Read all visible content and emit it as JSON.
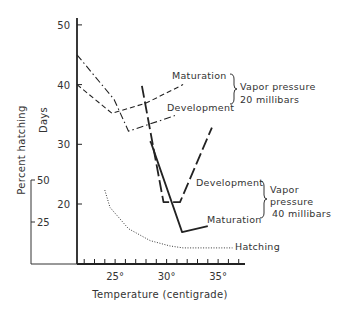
{
  "chart_data": {
    "type": "line",
    "title": "",
    "xlabel": "Temperature (centigrade)",
    "ylabel": "Days",
    "y2label": "Percent hatching",
    "xlim": [
      21.3,
      37.5
    ],
    "ylim": [
      10,
      51
    ],
    "y2lim": [
      0,
      50
    ],
    "x_ticks_minor_step": 1,
    "x_tick_labels": [
      {
        "value": 25,
        "label": "25°"
      },
      {
        "value": 30,
        "label": "30°"
      },
      {
        "value": 35,
        "label": "35°"
      }
    ],
    "y_tick_labels": [
      {
        "value": 20,
        "label": "20"
      },
      {
        "value": 30,
        "label": "30"
      },
      {
        "value": 40,
        "label": "40"
      },
      {
        "value": 50,
        "label": "50"
      }
    ],
    "y2_tick_labels": [
      {
        "value": 25,
        "label": "25"
      },
      {
        "value": 50,
        "label": "50"
      }
    ],
    "grid": false,
    "series": [
      {
        "name": "Maturation (20 millibars)",
        "axis": "days",
        "style": "dashed",
        "x": [
          21.3,
          24.7,
          28.0,
          31.6
        ],
        "y": [
          40.0,
          35.2,
          36.9,
          40.0
        ]
      },
      {
        "name": "Development (20 millibars)",
        "axis": "days",
        "style": "dash-dot",
        "x": [
          21.3,
          24.9,
          26.3,
          30.8
        ],
        "y": [
          45.0,
          37.5,
          32.2,
          34.8
        ]
      },
      {
        "name": "Development (40 millibars)",
        "axis": "days",
        "style": "long-dash",
        "x": [
          27.6,
          29.7,
          31.3,
          34.4
        ],
        "y": [
          39.8,
          20.3,
          20.3,
          32.8
        ]
      },
      {
        "name": "Maturation (40 millibars)",
        "axis": "days",
        "style": "solid",
        "x": [
          28.4,
          28.5,
          31.5,
          34.0
        ],
        "y": [
          30.5,
          30.2,
          15.3,
          16.3
        ]
      },
      {
        "name": "Hatching",
        "axis": "percent",
        "style": "dotted",
        "x": [
          24.0,
          24.5,
          26.3,
          28.4,
          30.3,
          31.6,
          36.4
        ],
        "y": [
          44.0,
          33.7,
          21.0,
          13.9,
          10.8,
          9.6,
          9.6
        ]
      }
    ],
    "annotations": {
      "label_maturation_20": "Maturation",
      "label_development_20": "Development",
      "group_20_line1": "Vapor pressure",
      "group_20_line2": "20 millibars",
      "label_development_40": "Development",
      "label_maturation_40": "Maturation",
      "group_40_line1": "Vapor",
      "group_40_line2": "pressure",
      "group_40_line3": "40 millibars",
      "label_hatching": "Hatching"
    }
  }
}
